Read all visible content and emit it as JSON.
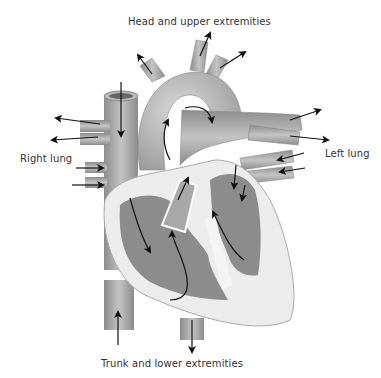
{
  "diagram": {
    "labels": {
      "head": "Head and upper extremities",
      "right_lung": "Right lung",
      "left_lung": "Left lung",
      "trunk": "Trunk and lower extremities"
    },
    "colors": {
      "vessel": "#9a9a9a",
      "vessel_light": "#c8c8c8",
      "chamber": "#8a8a8a",
      "wall": "#e8e8e8",
      "arrow": "#111111",
      "text": "#333333"
    }
  }
}
